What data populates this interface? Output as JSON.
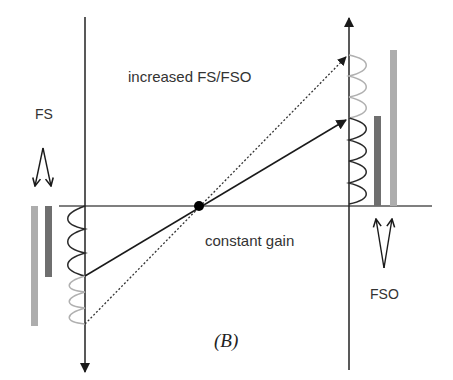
{
  "labels": {
    "increased": "increased FS/FSO",
    "constant": "constant gain",
    "fs": "FS",
    "fso": "FSO",
    "panel": "(B)"
  },
  "colors": {
    "axis": "#1a1a1a",
    "wave_dark": "#2a2a2a",
    "wave_light": "#b0b0b0",
    "bar_dark": "#6f6f6f",
    "bar_light": "#adadad",
    "text": "#333333"
  },
  "diagram": {
    "pivot": {
      "x": 199,
      "y": 206
    },
    "left_axis_x": 85,
    "right_axis_x": 349,
    "horizontal_axis_y": 206,
    "lines": [
      {
        "name": "constant gain",
        "style": "solid",
        "from": [
          85,
          276
        ],
        "to": [
          349,
          119
        ]
      },
      {
        "name": "increased FS/FSO",
        "style": "dotted",
        "from": [
          85,
          324
        ],
        "to": [
          349,
          55
        ]
      }
    ],
    "bars": {
      "left": [
        {
          "shade": "light",
          "top": 206,
          "bottom": 326
        },
        {
          "shade": "dark",
          "top": 206,
          "bottom": 277
        }
      ],
      "right": [
        {
          "shade": "dark",
          "top": 116,
          "bottom": 206
        },
        {
          "shade": "light",
          "top": 50,
          "bottom": 206
        }
      ]
    }
  }
}
